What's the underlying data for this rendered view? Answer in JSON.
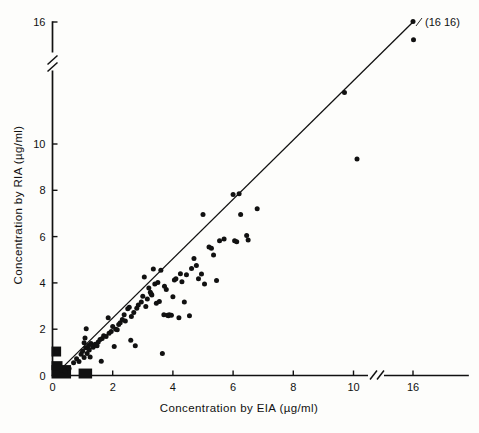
{
  "figure": {
    "caption_annotation": "(16 16)",
    "background_color": "#fdfdfb",
    "ink_color": "#111111"
  },
  "chart_data": {
    "type": "scatter",
    "title": "",
    "xlabel": "Concentration by EIA (µg/ml)",
    "ylabel": "Concentration by RIA (µg/ml)",
    "xlim": [
      0,
      16
    ],
    "ylim": [
      0,
      16
    ],
    "grid": false,
    "legend": null,
    "x_ticks": [
      0,
      2,
      4,
      6,
      8,
      10,
      16
    ],
    "x_tick_labels": [
      "0",
      "2",
      "4",
      "6",
      "8",
      "10",
      "16"
    ],
    "y_ticks": [
      0,
      2,
      4,
      6,
      8,
      10,
      16
    ],
    "y_tick_labels": [
      "0",
      "2",
      "4",
      "6",
      "8",
      "10",
      "16"
    ],
    "axis_breaks": {
      "x_break_between": [
        10,
        16
      ],
      "y_break_between": [
        10,
        16
      ]
    },
    "fit_line": {
      "type": "linear-regression",
      "x_start": 0.1,
      "y_start": 0.05,
      "x_end": 16.0,
      "y_end": 16.0
    },
    "annotations": [
      {
        "text": "(16 16)",
        "x": 16.0,
        "y": 16.0,
        "placement": "right"
      }
    ],
    "dense_clusters": [
      {
        "note": "solid block of overlapping points at origin",
        "x_range": [
          0.0,
          0.55
        ],
        "y_range": [
          0.0,
          0.45
        ]
      },
      {
        "note": "solid block of overlapping points on y-axis",
        "x_range": [
          0.0,
          0.22
        ],
        "y_range": [
          0.95,
          1.25
        ]
      },
      {
        "note": "small block of overlapping points",
        "x_range": [
          0.9,
          1.25
        ],
        "y_range": [
          0.0,
          0.3
        ]
      }
    ],
    "points": [
      {
        "x": 0.15,
        "y": 1.12
      },
      {
        "x": 0.15,
        "y": 1.02
      },
      {
        "x": 0.3,
        "y": 0.22
      },
      {
        "x": 0.42,
        "y": 0.18
      },
      {
        "x": 0.55,
        "y": 0.3
      },
      {
        "x": 0.7,
        "y": 0.55
      },
      {
        "x": 0.8,
        "y": 0.72
      },
      {
        "x": 0.88,
        "y": 0.6
      },
      {
        "x": 0.95,
        "y": 0.92
      },
      {
        "x": 1.0,
        "y": 1.05
      },
      {
        "x": 1.05,
        "y": 0.78
      },
      {
        "x": 1.05,
        "y": 1.42
      },
      {
        "x": 1.08,
        "y": 1.62
      },
      {
        "x": 1.1,
        "y": 1.2
      },
      {
        "x": 1.12,
        "y": 2.02
      },
      {
        "x": 1.15,
        "y": 0.95
      },
      {
        "x": 1.18,
        "y": 1.18
      },
      {
        "x": 1.2,
        "y": 1.3
      },
      {
        "x": 1.22,
        "y": 1.1
      },
      {
        "x": 1.25,
        "y": 0.8
      },
      {
        "x": 1.28,
        "y": 1.38
      },
      {
        "x": 1.35,
        "y": 1.22
      },
      {
        "x": 1.38,
        "y": 1.3
      },
      {
        "x": 1.42,
        "y": 1.35
      },
      {
        "x": 1.48,
        "y": 1.28
      },
      {
        "x": 1.52,
        "y": 1.45
      },
      {
        "x": 1.58,
        "y": 1.55
      },
      {
        "x": 1.62,
        "y": 0.62
      },
      {
        "x": 1.65,
        "y": 1.6
      },
      {
        "x": 1.7,
        "y": 1.72
      },
      {
        "x": 1.78,
        "y": 1.68
      },
      {
        "x": 1.85,
        "y": 2.5
      },
      {
        "x": 1.88,
        "y": 1.82
      },
      {
        "x": 1.95,
        "y": 1.9
      },
      {
        "x": 2.0,
        "y": 2.12
      },
      {
        "x": 2.05,
        "y": 1.25
      },
      {
        "x": 2.1,
        "y": 2.0
      },
      {
        "x": 2.15,
        "y": 1.98
      },
      {
        "x": 2.2,
        "y": 2.2
      },
      {
        "x": 2.25,
        "y": 2.28
      },
      {
        "x": 2.32,
        "y": 2.42
      },
      {
        "x": 2.38,
        "y": 2.62
      },
      {
        "x": 2.42,
        "y": 2.35
      },
      {
        "x": 2.5,
        "y": 2.88
      },
      {
        "x": 2.55,
        "y": 2.95
      },
      {
        "x": 2.6,
        "y": 1.52
      },
      {
        "x": 2.62,
        "y": 2.55
      },
      {
        "x": 2.7,
        "y": 2.72
      },
      {
        "x": 2.75,
        "y": 1.28
      },
      {
        "x": 2.8,
        "y": 2.9
      },
      {
        "x": 2.85,
        "y": 3.05
      },
      {
        "x": 2.95,
        "y": 3.18
      },
      {
        "x": 3.0,
        "y": 3.42
      },
      {
        "x": 3.05,
        "y": 4.25
      },
      {
        "x": 3.1,
        "y": 2.98
      },
      {
        "x": 3.15,
        "y": 3.3
      },
      {
        "x": 3.2,
        "y": 3.78
      },
      {
        "x": 3.25,
        "y": 3.6
      },
      {
        "x": 3.28,
        "y": 3.52
      },
      {
        "x": 3.3,
        "y": 3.48
      },
      {
        "x": 3.35,
        "y": 4.6
      },
      {
        "x": 3.4,
        "y": 3.95
      },
      {
        "x": 3.45,
        "y": 3.12
      },
      {
        "x": 3.5,
        "y": 4.02
      },
      {
        "x": 3.55,
        "y": 3.2
      },
      {
        "x": 3.6,
        "y": 4.55
      },
      {
        "x": 3.65,
        "y": 0.95
      },
      {
        "x": 3.7,
        "y": 2.62
      },
      {
        "x": 3.72,
        "y": 3.85
      },
      {
        "x": 3.78,
        "y": 3.72
      },
      {
        "x": 3.82,
        "y": 2.6
      },
      {
        "x": 3.85,
        "y": 2.58
      },
      {
        "x": 3.88,
        "y": 2.62
      },
      {
        "x": 3.95,
        "y": 2.6
      },
      {
        "x": 4.0,
        "y": 3.4
      },
      {
        "x": 4.05,
        "y": 4.12
      },
      {
        "x": 4.1,
        "y": 4.18
      },
      {
        "x": 4.2,
        "y": 2.5
      },
      {
        "x": 4.25,
        "y": 4.4
      },
      {
        "x": 4.3,
        "y": 4.05
      },
      {
        "x": 4.38,
        "y": 3.18
      },
      {
        "x": 4.45,
        "y": 4.35
      },
      {
        "x": 4.55,
        "y": 2.58
      },
      {
        "x": 4.62,
        "y": 4.62
      },
      {
        "x": 4.7,
        "y": 5.05
      },
      {
        "x": 4.78,
        "y": 4.75
      },
      {
        "x": 4.85,
        "y": 4.18
      },
      {
        "x": 4.95,
        "y": 4.38
      },
      {
        "x": 5.0,
        "y": 6.95
      },
      {
        "x": 5.05,
        "y": 3.95
      },
      {
        "x": 5.2,
        "y": 5.55
      },
      {
        "x": 5.28,
        "y": 5.5
      },
      {
        "x": 5.35,
        "y": 5.2
      },
      {
        "x": 5.45,
        "y": 4.1
      },
      {
        "x": 5.55,
        "y": 5.82
      },
      {
        "x": 5.7,
        "y": 5.9
      },
      {
        "x": 6.0,
        "y": 7.82
      },
      {
        "x": 6.05,
        "y": 5.82
      },
      {
        "x": 6.12,
        "y": 5.78
      },
      {
        "x": 6.2,
        "y": 7.85
      },
      {
        "x": 6.25,
        "y": 6.95
      },
      {
        "x": 6.45,
        "y": 6.05
      },
      {
        "x": 6.5,
        "y": 5.85
      },
      {
        "x": 6.8,
        "y": 7.2
      },
      {
        "x": 9.7,
        "y": 10.2
      },
      {
        "x": 10.4,
        "y": 9.35
      },
      {
        "x": 16.0,
        "y": 16.05
      },
      {
        "x": 16.05,
        "y": 14.55
      }
    ]
  }
}
